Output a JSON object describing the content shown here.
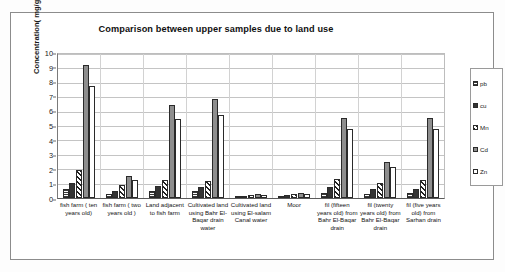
{
  "chart_data": {
    "type": "bar",
    "title": "Comparison between upper samples due to land use",
    "xlabel": "",
    "ylabel": "Concentration( mg/g)",
    "ylim": [
      0,
      10
    ],
    "yticks": [
      0,
      1,
      2,
      3,
      4,
      5,
      6,
      7,
      8,
      9,
      10
    ],
    "grid": true,
    "legend_position": "right",
    "categories": [
      "fish farm ( ten years old)",
      "fish farm ( two years old )",
      "Land adjacent to fish farm",
      "Cultivated land using Bahr El-Baqar drain water",
      "Cultivated land using El-salam Canal water",
      "Moor",
      "fil (fifteen years old) from Bahr El-Baqar drain",
      "fil (twenty years old) from Bahr El-Baqar drain",
      "fil (five years old) from Sarhan drain"
    ],
    "series": [
      {
        "name": "pb",
        "values": [
          0.6,
          0.3,
          0.5,
          0.5,
          0.1,
          0.15,
          0.35,
          0.3,
          0.35
        ]
      },
      {
        "name": "cu",
        "values": [
          1.0,
          0.5,
          0.8,
          0.75,
          0.15,
          0.2,
          0.75,
          0.6,
          0.65
        ]
      },
      {
        "name": "Mn",
        "values": [
          1.9,
          0.9,
          1.2,
          1.15,
          0.2,
          0.3,
          1.3,
          1.0,
          1.2
        ]
      },
      {
        "name": "Cd",
        "values": [
          9.1,
          1.5,
          6.4,
          6.75,
          0.25,
          0.35,
          5.5,
          2.5,
          5.5
        ]
      },
      {
        "name": "Zn",
        "values": [
          7.7,
          1.2,
          5.4,
          5.7,
          0.2,
          0.3,
          4.7,
          2.1,
          4.7
        ]
      }
    ],
    "series_colors": {
      "pb": "#d9d9d9",
      "cu": "#333333",
      "Mn": "#ffffff",
      "Cd": "#8e8e8e",
      "Zn": "#ffffff"
    }
  },
  "legend": {
    "items": [
      {
        "label": "pb"
      },
      {
        "label": "cu"
      },
      {
        "label": "Mn"
      },
      {
        "label": "Cd"
      },
      {
        "label": "Zn"
      }
    ]
  }
}
